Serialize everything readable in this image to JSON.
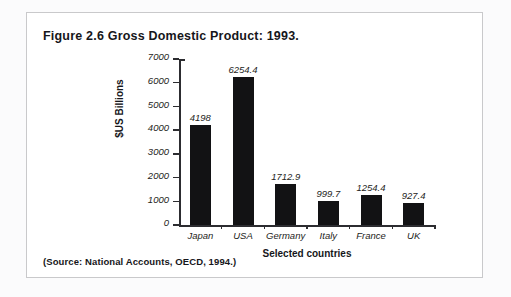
{
  "figure": {
    "title": "Figure 2.6  Gross Domestic Product: 1993.",
    "source": "(Source: National Accounts, OECD, 1994.)"
  },
  "chart_data": {
    "type": "bar",
    "title": "Figure 2.6  Gross Domestic Product: 1993.",
    "categories": [
      "Japan",
      "USA",
      "Germany",
      "Italy",
      "France",
      "UK"
    ],
    "values": [
      4198,
      6254.4,
      1712.9,
      999.7,
      1254.4,
      927.4
    ],
    "value_labels": [
      "4198",
      "6254.4",
      "1712.9",
      "999.7",
      "1254.4",
      "927.4"
    ],
    "xlabel": "Selected countries",
    "ylabel": "$US Billions",
    "ylim": [
      0,
      7000
    ],
    "yticks": [
      0,
      1000,
      2000,
      3000,
      4000,
      5000,
      6000,
      7000
    ],
    "ytick_labels": [
      "0",
      "1000",
      "2000",
      "3000",
      "4000",
      "5000",
      "6000",
      "7000"
    ],
    "grid": false,
    "legend": false,
    "bar_color": "#121214",
    "axis_color": "#2c2c30"
  }
}
